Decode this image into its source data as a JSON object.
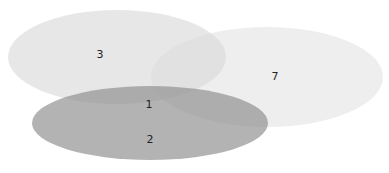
{
  "diagram": {
    "type": "venn",
    "sets": [
      {
        "id": "A",
        "cx": 117,
        "cy": 57,
        "rx": 109,
        "ry": 47,
        "color": "#d6d6d6",
        "opacity": 0.55
      },
      {
        "id": "B",
        "cx": 267,
        "cy": 77,
        "rx": 116,
        "ry": 50,
        "color": "#dedede",
        "opacity": 0.45
      },
      {
        "id": "C",
        "cx": 150,
        "cy": 123,
        "rx": 118,
        "ry": 37,
        "color": "#8f8f8f",
        "opacity": 0.7
      }
    ],
    "labels": [
      {
        "text": "3",
        "x": 100,
        "y": 57
      },
      {
        "text": "7",
        "x": 275,
        "y": 77
      },
      {
        "text": "1",
        "x": 149,
        "y": 107
      },
      {
        "text": "2",
        "x": 150,
        "y": 142
      }
    ]
  }
}
